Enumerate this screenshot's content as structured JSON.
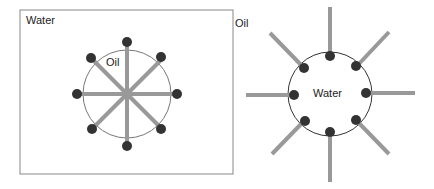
{
  "left_panel": {
    "outer_label": "Water",
    "inner_label": "Oil",
    "title": "Micelle (oil-in-water)"
  },
  "right_panel": {
    "outer_label": "Oil",
    "inner_label": "Water",
    "title": "Reverse micelle (water-in-oil)"
  },
  "colors": {
    "tail": "#999999",
    "head": "#333333",
    "line": "#555555"
  }
}
